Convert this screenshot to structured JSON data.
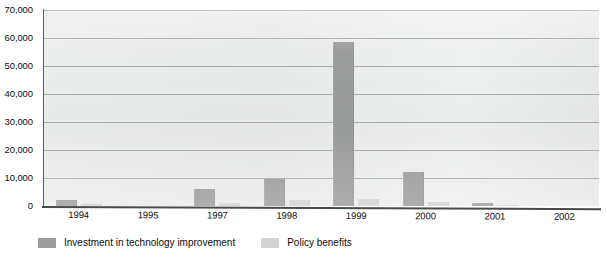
{
  "chart_data": {
    "type": "bar",
    "title": "",
    "xlabel": "",
    "ylabel": "",
    "categories": [
      "1994",
      "1995",
      "1997",
      "1998",
      "1999",
      "2000",
      "2001",
      "2002"
    ],
    "series": [
      {
        "name": "Investment in technology improvement",
        "color": "#9b9c9c",
        "values": [
          2000,
          0,
          6000,
          9500,
          58500,
          12000,
          1000,
          0
        ]
      },
      {
        "name": "Policy benefits",
        "color": "#d2d3d3",
        "values": [
          700,
          0,
          1200,
          2000,
          2500,
          1500,
          500,
          0
        ]
      }
    ],
    "ylim": [
      0,
      70000
    ],
    "ytick_values": [
      0,
      10000,
      20000,
      30000,
      40000,
      50000,
      60000,
      70000
    ],
    "ytick_labels": [
      "0",
      "10,000",
      "20,000",
      "30,000",
      "40,000",
      "50,000",
      "60,000",
      "70,000"
    ],
    "grid": true,
    "legend_position": "bottom-left",
    "plot_background": "#eceded",
    "gridline_color": "#a9abab",
    "axis_color": "#47494a"
  }
}
